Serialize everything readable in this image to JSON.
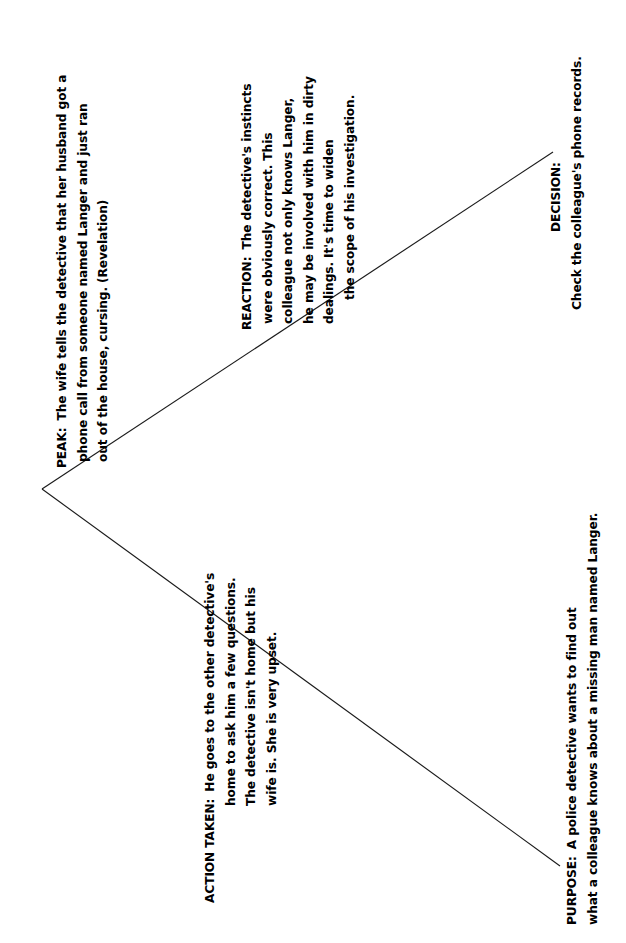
{
  "diagram": {
    "type": "story-arc-plot-diagram",
    "orientation": "rotated-90-counterclockwise",
    "background_color": "#ffffff",
    "line_color": "#1a1a1a",
    "apex": {
      "x": 42,
      "y": 489
    },
    "upper_end": {
      "x": 553,
      "y": 152
    },
    "lower_end": {
      "x": 560,
      "y": 866
    }
  },
  "nodes": {
    "peak": {
      "label": "PEAK:",
      "lines": [
        "The wife tells the detective that her husband got a",
        "phone call from someone named Langer and just ran",
        "out of the house, cursing.  (Revelation)"
      ]
    },
    "reaction": {
      "label": "REACTION:",
      "lines": [
        "The detective's instincts",
        "were obviously correct.   This",
        "colleague not only knows Langer,",
        "he may be involved with him in dirty",
        "dealings.  It's time to widen",
        "the scope of his investigation."
      ]
    },
    "decision": {
      "label": "DECISION:",
      "lines": [
        "Check the colleague's phone records."
      ]
    },
    "action_taken": {
      "label": "ACTION TAKEN:",
      "lines": [
        "He goes to the other detective's",
        "home to ask him a few questions.",
        "The detective isn't home but his",
        "wife is.  She is very upset."
      ]
    },
    "purpose": {
      "label": "PURPOSE:",
      "lines": [
        "A police detective wants to find out",
        "what a colleague knows about a missing man named Langer."
      ]
    }
  }
}
